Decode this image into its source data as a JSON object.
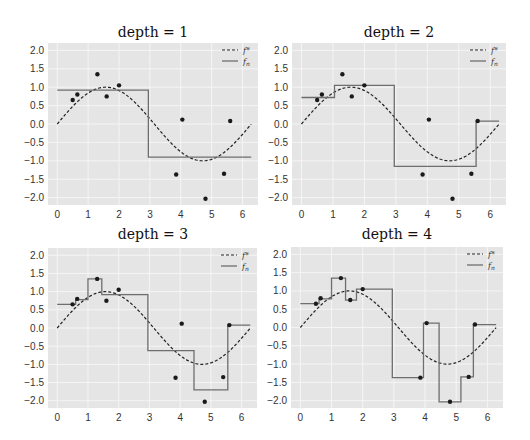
{
  "chart_data": [
    {
      "type": "line",
      "title": "depth = 1",
      "xlabel": "",
      "ylabel": "",
      "xlim": [
        -0.3,
        6.5
      ],
      "ylim": [
        -2.2,
        2.2
      ],
      "xticks": [
        "0",
        "1",
        "2",
        "3",
        "4",
        "5",
        "6"
      ],
      "yticks": [
        "2.0",
        "1.5",
        "1.0",
        "0.5",
        "0.0",
        "-0.5",
        "-1.0",
        "-1.5",
        "-2.0"
      ],
      "grid": true,
      "legend": {
        "position": "upper right",
        "entries": [
          "f*",
          "f_n"
        ]
      },
      "series": [
        {
          "name": "f*",
          "style": "dashed",
          "function": "sin(x)",
          "x_range": [
            0,
            6.28
          ]
        },
        {
          "name": "f_n",
          "style": "step",
          "steps": [
            [
              0,
              2.95,
              0.92
            ],
            [
              2.95,
              6.28,
              -0.9
            ]
          ]
        },
        {
          "name": "data",
          "style": "scatter",
          "points": [
            [
              0.5,
              0.65
            ],
            [
              0.65,
              0.8
            ],
            [
              1.3,
              1.35
            ],
            [
              1.6,
              0.75
            ],
            [
              2.0,
              1.05
            ],
            [
              3.85,
              -1.37
            ],
            [
              4.05,
              0.12
            ],
            [
              4.8,
              -2.03
            ],
            [
              5.4,
              -1.35
            ],
            [
              5.6,
              0.08
            ]
          ]
        }
      ]
    },
    {
      "type": "line",
      "title": "depth = 2",
      "xlabel": "",
      "ylabel": "",
      "xlim": [
        -0.3,
        6.5
      ],
      "ylim": [
        -2.2,
        2.2
      ],
      "xticks": [
        "0",
        "1",
        "2",
        "3",
        "4",
        "5",
        "6"
      ],
      "yticks": [
        "2.0",
        "1.5",
        "1.0",
        "0.5",
        "0.0",
        "-0.5",
        "-1.0",
        "-1.5",
        "-2.0"
      ],
      "grid": true,
      "legend": {
        "position": "upper right",
        "entries": [
          "f*",
          "f_n"
        ]
      },
      "series": [
        {
          "name": "f*",
          "style": "dashed",
          "function": "sin(x)",
          "x_range": [
            0,
            6.28
          ]
        },
        {
          "name": "f_n",
          "style": "step",
          "steps": [
            [
              0,
              1.05,
              0.72
            ],
            [
              1.05,
              2.95,
              1.05
            ],
            [
              2.95,
              5.55,
              -1.15
            ],
            [
              5.55,
              6.28,
              0.08
            ]
          ]
        },
        {
          "name": "data",
          "style": "scatter",
          "points": [
            [
              0.5,
              0.65
            ],
            [
              0.65,
              0.8
            ],
            [
              1.3,
              1.35
            ],
            [
              1.6,
              0.75
            ],
            [
              2.0,
              1.05
            ],
            [
              3.85,
              -1.37
            ],
            [
              4.05,
              0.12
            ],
            [
              4.8,
              -2.03
            ],
            [
              5.4,
              -1.35
            ],
            [
              5.6,
              0.08
            ]
          ]
        }
      ]
    },
    {
      "type": "line",
      "title": "depth = 3",
      "xlabel": "",
      "ylabel": "",
      "xlim": [
        -0.3,
        6.5
      ],
      "ylim": [
        -2.2,
        2.2
      ],
      "xticks": [
        "0",
        "1",
        "2",
        "3",
        "4",
        "5",
        "6"
      ],
      "yticks": [
        "2.0",
        "1.5",
        "1.0",
        "0.5",
        "0.0",
        "-0.5",
        "-1.0",
        "-1.5",
        "-2.0"
      ],
      "grid": true,
      "legend": {
        "position": "upper right",
        "entries": [
          "f*",
          "f_n"
        ]
      },
      "series": [
        {
          "name": "f*",
          "style": "dashed",
          "function": "sin(x)",
          "x_range": [
            0,
            6.28
          ]
        },
        {
          "name": "f_n",
          "style": "step",
          "steps": [
            [
              0,
              0.6,
              0.65
            ],
            [
              0.6,
              1.0,
              0.78
            ],
            [
              1.0,
              1.45,
              1.35
            ],
            [
              1.45,
              2.95,
              0.92
            ],
            [
              2.95,
              4.45,
              -0.62
            ],
            [
              4.45,
              5.55,
              -1.7
            ],
            [
              5.55,
              6.28,
              0.08
            ]
          ]
        },
        {
          "name": "data",
          "style": "scatter",
          "points": [
            [
              0.5,
              0.65
            ],
            [
              0.65,
              0.8
            ],
            [
              1.3,
              1.35
            ],
            [
              1.6,
              0.75
            ],
            [
              2.0,
              1.05
            ],
            [
              3.85,
              -1.37
            ],
            [
              4.05,
              0.12
            ],
            [
              4.8,
              -2.03
            ],
            [
              5.4,
              -1.35
            ],
            [
              5.6,
              0.08
            ]
          ]
        }
      ]
    },
    {
      "type": "line",
      "title": "depth = 4",
      "xlabel": "",
      "ylabel": "",
      "xlim": [
        -0.3,
        6.5
      ],
      "ylim": [
        -2.2,
        2.2
      ],
      "xticks": [
        "0",
        "1",
        "2",
        "3",
        "4",
        "5",
        "6"
      ],
      "yticks": [
        "2.0",
        "1.5",
        "1.0",
        "0.5",
        "0.0",
        "-0.5",
        "-1.0",
        "-1.5",
        "-2.0"
      ],
      "grid": true,
      "legend": {
        "position": "upper right",
        "entries": [
          "f*",
          "f_n"
        ]
      },
      "series": [
        {
          "name": "f*",
          "style": "dashed",
          "function": "sin(x)",
          "x_range": [
            0,
            6.28
          ]
        },
        {
          "name": "f_n",
          "style": "step",
          "steps": [
            [
              0,
              0.6,
              0.65
            ],
            [
              0.6,
              1.0,
              0.78
            ],
            [
              1.0,
              1.45,
              1.35
            ],
            [
              1.45,
              1.8,
              0.75
            ],
            [
              1.8,
              2.95,
              1.05
            ],
            [
              2.95,
              3.95,
              -1.37
            ],
            [
              3.95,
              4.45,
              0.12
            ],
            [
              4.45,
              5.15,
              -2.03
            ],
            [
              5.15,
              5.55,
              -1.35
            ],
            [
              5.55,
              6.28,
              0.08
            ]
          ]
        },
        {
          "name": "data",
          "style": "scatter",
          "points": [
            [
              0.5,
              0.65
            ],
            [
              0.65,
              0.8
            ],
            [
              1.3,
              1.35
            ],
            [
              1.6,
              0.75
            ],
            [
              2.0,
              1.05
            ],
            [
              3.85,
              -1.37
            ],
            [
              4.05,
              0.12
            ],
            [
              4.8,
              -2.03
            ],
            [
              5.4,
              -1.35
            ],
            [
              5.6,
              0.08
            ]
          ]
        }
      ]
    }
  ],
  "panels": [
    {
      "title": "depth = 1"
    },
    {
      "title": "depth = 2"
    },
    {
      "title": "depth = 3"
    },
    {
      "title": "depth = 4"
    }
  ],
  "legend": {
    "true_label": "f*",
    "approx_label": "f",
    "approx_sub": "n"
  },
  "colors": {
    "background": "#e5e5e5",
    "grid": "#f5f5f5",
    "true_line": "#222222",
    "step_line": "#6e6e6e",
    "points": "#1a1a1a"
  }
}
